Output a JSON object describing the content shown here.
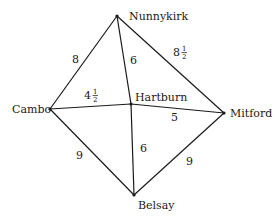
{
  "graph": {
    "nodes": [
      {
        "id": "nunnykirk",
        "label": "Nunnykirk",
        "x": 117,
        "y": 16,
        "lx": 129,
        "ly": 20
      },
      {
        "id": "cambo",
        "label": "Cambo",
        "x": 50,
        "y": 109,
        "lx": 12,
        "ly": 113
      },
      {
        "id": "hartburn",
        "label": "Hartburn",
        "x": 131,
        "y": 104,
        "lx": 135,
        "ly": 101
      },
      {
        "id": "mitford",
        "label": "Mitford",
        "x": 224,
        "y": 113,
        "lx": 230,
        "ly": 117
      },
      {
        "id": "belsay",
        "label": "Belsay",
        "x": 134,
        "y": 195,
        "lx": 138,
        "ly": 209
      }
    ],
    "edges": [
      {
        "from": "nunnykirk",
        "to": "cambo",
        "weight": "8",
        "whole": "8",
        "frac": "",
        "lx": 72,
        "ly": 63
      },
      {
        "from": "nunnykirk",
        "to": "hartburn",
        "weight": "6",
        "whole": "6",
        "frac": "",
        "lx": 130,
        "ly": 64
      },
      {
        "from": "nunnykirk",
        "to": "mitford",
        "weight": "8 1/2",
        "whole": "8",
        "frac": "1/2",
        "lx": 173,
        "ly": 56
      },
      {
        "from": "cambo",
        "to": "hartburn",
        "weight": "4 1/2",
        "whole": "4",
        "frac": "1/2",
        "lx": 84,
        "ly": 99
      },
      {
        "from": "hartburn",
        "to": "mitford",
        "weight": "5",
        "whole": "5",
        "frac": "",
        "lx": 171,
        "ly": 121
      },
      {
        "from": "cambo",
        "to": "belsay",
        "weight": "9",
        "whole": "9",
        "frac": "",
        "lx": 76,
        "ly": 159
      },
      {
        "from": "hartburn",
        "to": "belsay",
        "weight": "6",
        "whole": "6",
        "frac": "",
        "lx": 140,
        "ly": 152
      },
      {
        "from": "mitford",
        "to": "belsay",
        "weight": "9",
        "whole": "9",
        "frac": "",
        "lx": 186,
        "ly": 165
      }
    ]
  }
}
